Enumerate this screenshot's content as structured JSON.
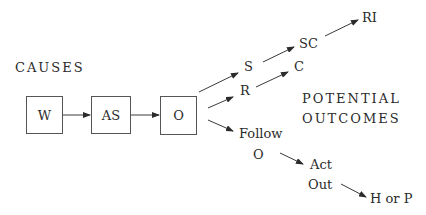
{
  "diagram": {
    "sections": {
      "causes": "CAUSES",
      "outcomes_line1": "POTENTIAL",
      "outcomes_line2": "OUTCOMES"
    },
    "cause_boxes": [
      {
        "id": "w",
        "label": "W"
      },
      {
        "id": "as",
        "label": "AS"
      },
      {
        "id": "o",
        "label": "O"
      }
    ],
    "outcomes": {
      "s": "S",
      "sc": "SC",
      "ri": "RI",
      "r": "R",
      "c": "C",
      "follow_line1": "Follow",
      "follow_line2": "O",
      "act_line1": "Act",
      "act_line2": "Out",
      "h_or_p": "H or P"
    },
    "edges": [
      [
        "W",
        "AS"
      ],
      [
        "AS",
        "O"
      ],
      [
        "O",
        "S"
      ],
      [
        "S",
        "SC"
      ],
      [
        "SC",
        "RI"
      ],
      [
        "O",
        "R"
      ],
      [
        "R",
        "C"
      ],
      [
        "O",
        "Follow O"
      ],
      [
        "Follow O",
        "Act Out"
      ],
      [
        "Act Out",
        "H or P"
      ]
    ]
  }
}
